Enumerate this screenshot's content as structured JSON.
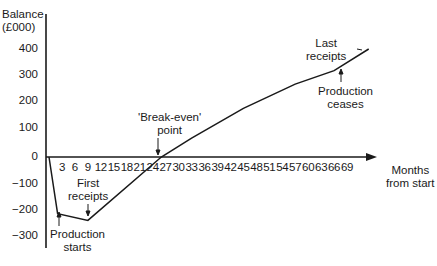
{
  "chart_data": {
    "type": "line",
    "title": "",
    "ylabel": "Balance (£000)",
    "xlabel": "Months from start",
    "ylim": [
      -300,
      400
    ],
    "xlim": [
      0,
      75
    ],
    "grid": false,
    "legend": null,
    "y_ticks": [
      "400",
      "300",
      "200",
      "100",
      "0",
      "−100",
      "−200",
      "−300"
    ],
    "x_ticks": [
      "3",
      "6",
      "9",
      "12",
      "15",
      "18",
      "21",
      "24",
      "27",
      "30",
      "33",
      "36",
      "39",
      "42",
      "45",
      "48",
      "51",
      "54",
      "57",
      "60",
      "63",
      "66",
      "69"
    ],
    "series": [
      {
        "name": "Cumulative balance",
        "x": [
          0,
          2,
          9,
          26,
          33,
          45,
          57,
          66,
          74
        ],
        "y": [
          0,
          -210,
          -235,
          0,
          70,
          180,
          270,
          320,
          400
        ]
      }
    ],
    "annotations": [
      {
        "text": "Production starts",
        "x": 2,
        "y": -210
      },
      {
        "text": "First receipts",
        "x": 9,
        "y": -235
      },
      {
        "text": "'Break-even' point",
        "x": 26,
        "y": 0
      },
      {
        "text": "Production ceases",
        "x": 66,
        "y": 320
      },
      {
        "text": "Last receipts",
        "x": 74,
        "y": 400
      }
    ]
  },
  "labels": {
    "ylabel_line1": "Balance",
    "ylabel_line2": "(£000)",
    "xlabel_line1": "Months",
    "xlabel_line2": "from start",
    "production_starts_1": "Production",
    "production_starts_2": "starts",
    "first_receipts_1": "First",
    "first_receipts_2": "receipts",
    "break_even_1": "'Break-even'",
    "break_even_2": "point",
    "production_ceases_1": "Production",
    "production_ceases_2": "ceases",
    "last_receipts_1": "Last",
    "last_receipts_2": "receipts"
  },
  "colors": {
    "line": "#1a1a1a",
    "background": "#ffffff"
  }
}
